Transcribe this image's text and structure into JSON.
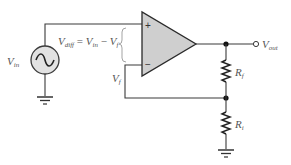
{
  "diagram": {
    "colors": {
      "wire": "#3a3a3a",
      "opamp_fill": "#cfcfcf",
      "source_fill": "#e2e2e2",
      "label": "#555555"
    },
    "source": {
      "label_main": "V",
      "label_sub": "in",
      "icon": "ac-sine-icon"
    },
    "equation": {
      "lhs_main": "V",
      "lhs_sub": "diff",
      "equals": " = ",
      "term1_main": "V",
      "term1_sub": "in",
      "minus": " − ",
      "term2_main": "V",
      "term2_sub": "f"
    },
    "opamp": {
      "plus": "+",
      "minus": "−"
    },
    "feedback_label": {
      "main": "V",
      "sub": "f"
    },
    "output": {
      "main": "V",
      "sub": "out"
    },
    "resistors": [
      {
        "main": "R",
        "sub": "f"
      },
      {
        "main": "R",
        "sub": "i"
      }
    ]
  }
}
